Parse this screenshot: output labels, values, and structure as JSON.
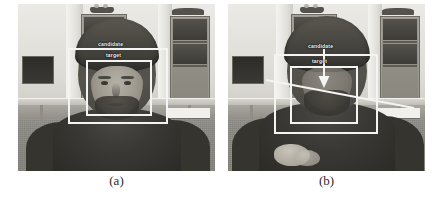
{
  "figure": {
    "panels": [
      {
        "id": "a",
        "caption": "(a)",
        "annotations": {
          "candidate_label": "candidate",
          "target_label": "target"
        }
      },
      {
        "id": "b",
        "caption": "(b)",
        "annotations": {
          "candidate_label": "candidate",
          "target_label": "target"
        }
      }
    ],
    "colors": {
      "annotation_stroke": "#f4f4f2",
      "caption_text": "#2c2c2c",
      "page_background": "#ffffff"
    }
  }
}
